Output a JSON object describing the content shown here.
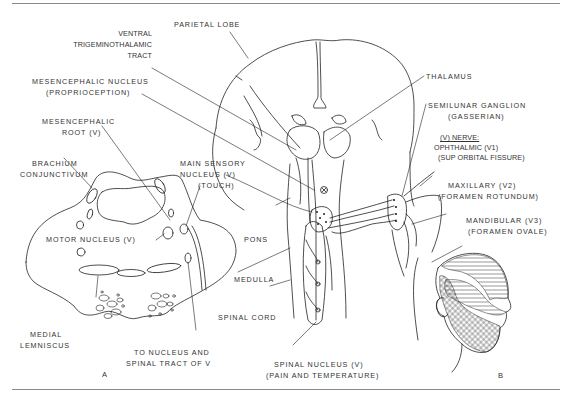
{
  "diagram": {
    "panels": [
      {
        "id": "A",
        "label": "A"
      },
      {
        "id": "B",
        "label": "B"
      }
    ],
    "labels": {
      "parietal_lobe": "PARIETAL LOBE",
      "ventral_tract_1": "VENTRAL",
      "ventral_tract_2": "TRIGEMINOTHALAMIC",
      "ventral_tract_3": "TRACT",
      "mes_nucleus_1": "MESENCEPHALIC NUCLEUS",
      "mes_nucleus_2": "(PROPRIOCEPTION)",
      "mes_root_1": "MESENCEPHALIC",
      "mes_root_2": "ROOT (V)",
      "brachium_1": "BRACHIUM",
      "brachium_2": "CONJUNCTIVUM",
      "main_sensory_1": "MAIN SENSORY",
      "main_sensory_2": "NUCLEUS (V)",
      "main_sensory_3": "(TOUCH)",
      "motor_nucleus": "MOTOR NUCLEUS (V)",
      "pons": "PONS",
      "medulla": "MEDULLA",
      "spinal_cord": "SPINAL CORD",
      "medial_lemniscus_1": "MEDIAL",
      "medial_lemniscus_2": "LEMNISCUS",
      "to_nucleus_1": "TO NUCLEUS AND",
      "to_nucleus_2": "SPINAL TRACT OF V",
      "spinal_nucleus_1": "SPINAL NUCLEUS (V)",
      "spinal_nucleus_2": "(PAIN AND TEMPERATURE)",
      "thalamus": "THALAMUS",
      "semilunar_1": "SEMILUNAR GANGLION",
      "semilunar_2": "(GASSERIAN)",
      "v_nerve": "(V) NERVE:",
      "ophthalmic_1": "OPHTHALMIC (V1)",
      "ophthalmic_2": "(SUP ORBITAL FISSURE)",
      "maxillary_1": "MAXILLARY (V2)",
      "maxillary_2": "(FORAMEN ROTUNDUM)",
      "mandibular_1": "MANDIBULAR (V3)",
      "mandibular_2": "(FORAMEN OVALE)"
    }
  }
}
